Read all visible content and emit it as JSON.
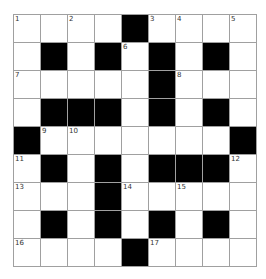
{
  "puzzle": {
    "rows": 9,
    "cols": 9,
    "colors": {
      "block": "#000000",
      "open": "#ffffff",
      "line": "#a0a0a0"
    },
    "grid": [
      [
        "1",
        "",
        "2",
        "",
        "#",
        "3",
        "4",
        "",
        "5"
      ],
      [
        "",
        "#",
        "",
        "#",
        "6",
        "#",
        "",
        "#",
        ""
      ],
      [
        "7",
        "",
        "",
        "",
        "",
        "#",
        "8",
        "",
        ""
      ],
      [
        "",
        "#",
        "#",
        "#",
        "",
        "#",
        "",
        "#",
        ""
      ],
      [
        "#",
        "9",
        "10",
        "",
        "",
        "",
        "",
        "",
        "#"
      ],
      [
        "11",
        "#",
        "",
        "#",
        "",
        "#",
        "#",
        "#",
        "12"
      ],
      [
        "13",
        "",
        "",
        "#",
        "14",
        "",
        "15",
        "",
        ""
      ],
      [
        "",
        "#",
        "",
        "#",
        "",
        "#",
        "",
        "#",
        ""
      ],
      [
        "16",
        "",
        "",
        "",
        "#",
        "17",
        "",
        "",
        ""
      ]
    ],
    "clue_numbers": [
      "1",
      "2",
      "3",
      "4",
      "5",
      "6",
      "7",
      "8",
      "9",
      "10",
      "11",
      "12",
      "13",
      "14",
      "15",
      "16",
      "17"
    ]
  }
}
